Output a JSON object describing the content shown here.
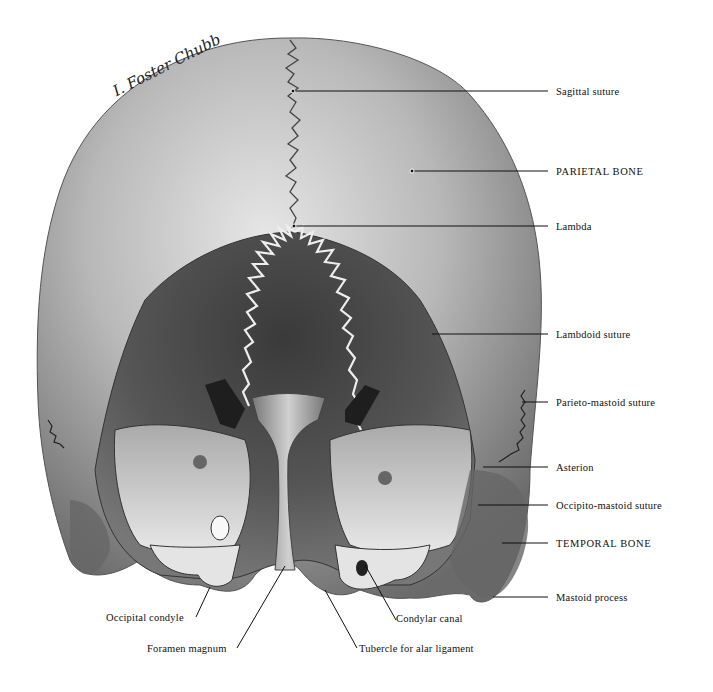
{
  "figure": {
    "signature": "I. Foster Chubb"
  },
  "labels": {
    "sagittal_suture": "Sagittal suture",
    "parietal_bone": "PARIETAL BONE",
    "lambda": "Lambda",
    "lambdoid_suture": "Lambdoid suture",
    "parieto_mastoid_suture": "Parieto-mastoid suture",
    "asterion": "Asterion",
    "occipito_mastoid_suture": "Occipito-mastoid suture",
    "temporal_bone": "TEMPORAL BONE",
    "mastoid_process": "Mastoid process",
    "occipital_condyle": "Occipital condyle",
    "foramen_magnum": "Foramen magnum",
    "condylar_canal": "Condylar canal",
    "tubercle_alar_ligament": "Tubercle for alar ligament"
  },
  "colors": {
    "background": "#ffffff",
    "bone_light": "#d8d8d8",
    "bone_mid": "#9a9a9a",
    "bone_dark": "#4a4a4a",
    "ink": "#111111"
  }
}
